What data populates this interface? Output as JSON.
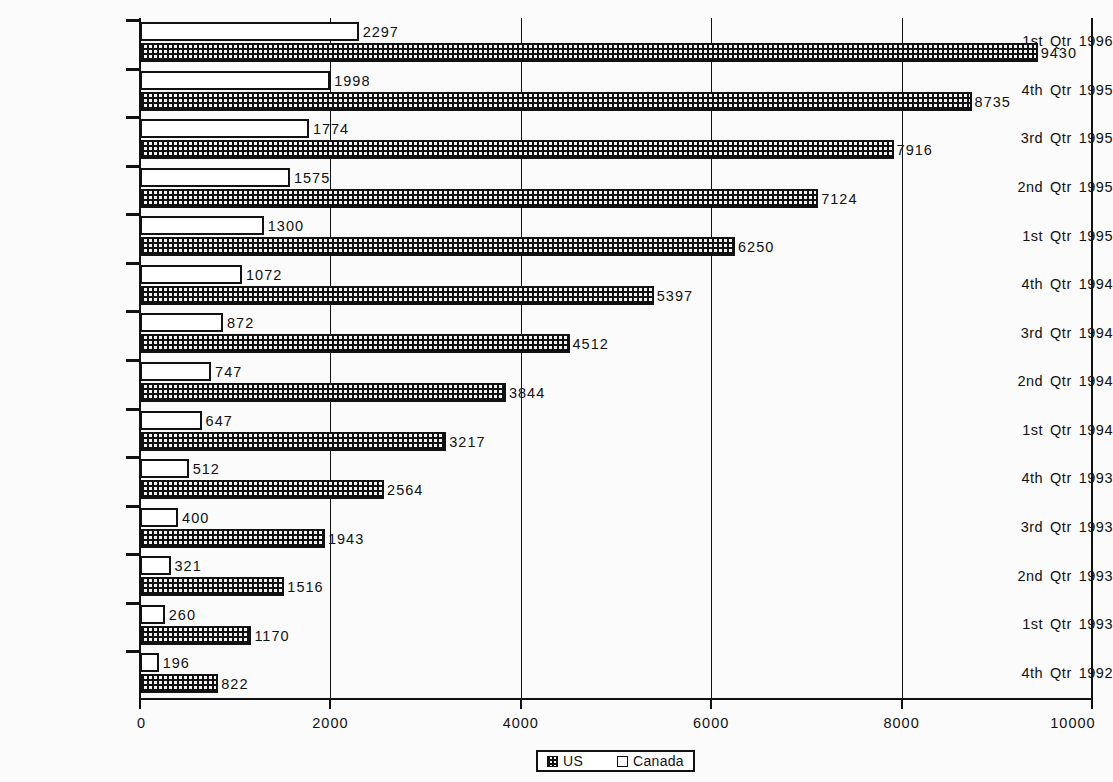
{
  "chart_data": {
    "type": "bar",
    "orientation": "horizontal",
    "title": "",
    "xlabel": "",
    "ylabel": "",
    "xlim": [
      0,
      10000
    ],
    "xticks": [
      0,
      2000,
      4000,
      6000,
      8000,
      10000
    ],
    "xtick_labels": [
      "0",
      "2000",
      "4000",
      "6000",
      "8000",
      "10000"
    ],
    "grid": true,
    "legend_position": "bottom",
    "categories": [
      "1st  Qtr  1996",
      "4th  Qtr  1995",
      "3rd  Qtr  1995",
      "2nd  Qtr  1995",
      "1st  Qtr  1995",
      "4th  Qtr  1994",
      "3rd  Qtr  1994",
      "2nd  Qtr  1994",
      "1st  Qtr  1994",
      "4th  Qtr  1993",
      "3rd  Qtr  1993",
      "2nd  Qtr  1993",
      "1st  Qtr  1993",
      "4th  Qtr  1992"
    ],
    "category_parts": [
      [
        "1st",
        "Qtr",
        "1996"
      ],
      [
        "4th",
        "Qtr",
        "1995"
      ],
      [
        "3rd",
        "Qtr",
        "1995"
      ],
      [
        "2nd",
        "Qtr",
        "1995"
      ],
      [
        "1st",
        "Qtr",
        "1995"
      ],
      [
        "4th",
        "Qtr",
        "1994"
      ],
      [
        "3rd",
        "Qtr",
        "1994"
      ],
      [
        "2nd",
        "Qtr",
        "1994"
      ],
      [
        "1st",
        "Qtr",
        "1994"
      ],
      [
        "4th",
        "Qtr",
        "1993"
      ],
      [
        "3rd",
        "Qtr",
        "1993"
      ],
      [
        "2nd",
        "Qtr",
        "1993"
      ],
      [
        "1st",
        "Qtr",
        "1993"
      ],
      [
        "4th",
        "Qtr",
        "1992"
      ]
    ],
    "series": [
      {
        "name": "Canada",
        "fill": "hollow",
        "values": [
          2297,
          1998,
          1774,
          1575,
          1300,
          1072,
          872,
          747,
          647,
          512,
          400,
          321,
          260,
          196
        ]
      },
      {
        "name": "US",
        "fill": "dotted",
        "values": [
          9430,
          8735,
          7916,
          7124,
          6250,
          5397,
          4512,
          3844,
          3217,
          2564,
          1943,
          1516,
          1170,
          822
        ]
      }
    ]
  },
  "legend": {
    "entries": [
      {
        "label": "US",
        "swatch": "dotted-swatch"
      },
      {
        "label": "Canada",
        "swatch": "hollow-swatch"
      }
    ]
  },
  "colors": {
    "background": "#fbfbfb",
    "ink": "#111111",
    "canada_fill": "#ffffff",
    "us_fill": "#f2f2f2"
  }
}
